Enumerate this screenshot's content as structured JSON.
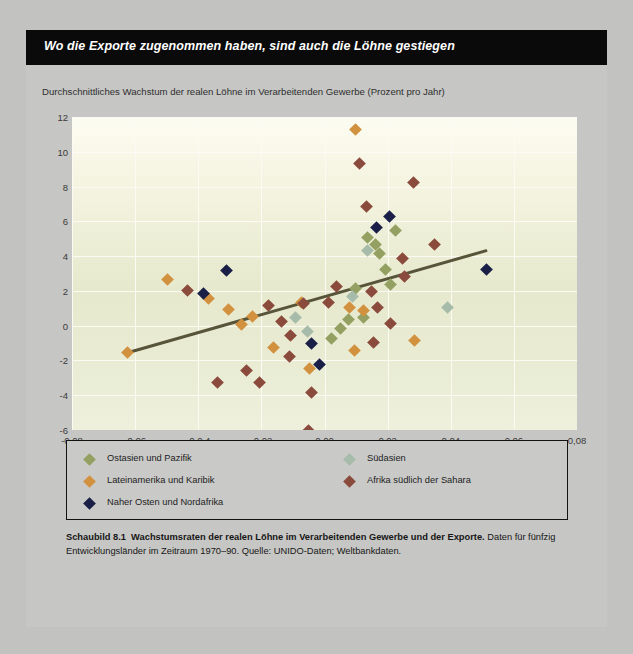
{
  "banner": {
    "title": "Wo die Exporte zugenommen haben, sind auch die Löhne gestiegen"
  },
  "legend": {
    "entries": [
      {
        "label": "Ostasien und Pazifik",
        "color": "#93a062"
      },
      {
        "label": "Lateinamerika und Karibik",
        "color": "#d2913f"
      },
      {
        "label": "Naher Osten und Nordafrika",
        "color": "#191f46"
      },
      {
        "label": "Südasien",
        "color": "#a7bbaa"
      },
      {
        "label": "Afrika südlich der Sahara",
        "color": "#8a4a3c"
      }
    ]
  },
  "caption": {
    "figure_number": "Schaubild 8.1",
    "bold_title": "Wachstumsraten der realen Löhne im Verarbeitenden Gewerbe und der Exporte.",
    "body": "Daten für fünfzig Entwicklungsländer im Zeitraum 1970–90. Quelle: UNIDO-Daten; Weltbankdaten."
  },
  "chart_data": {
    "type": "scatter",
    "title": "Wo die Exporte zugenommen haben, sind auch die Löhne gestiegen",
    "ylabel": "Durchschnittliches Wachstum der realen Löhne im Verarbeitenden Gewerbe (Prozent pro Jahr)",
    "xlabel": "Durchschnittliche jährliche Änderung der Exportquote (Exporte: BIP)",
    "xlim": [
      -0.08,
      0.08
    ],
    "ylim": [
      -6,
      12
    ],
    "xticks": [
      -0.08,
      -0.06,
      -0.04,
      -0.02,
      0.0,
      0.02,
      0.04,
      0.06,
      0.08
    ],
    "xticklabels": [
      "-0,08",
      "-0,06",
      "-0,0 4",
      "-0,02",
      "0,00",
      "0,02",
      "0,04",
      "0,06",
      "0,08"
    ],
    "yticks": [
      12,
      10,
      8,
      6,
      4,
      2,
      0,
      -2,
      -4,
      -6
    ],
    "yticklabels": [
      "12",
      "10",
      "8",
      "6",
      "4",
      "2",
      "0",
      "-2",
      "-4",
      "-6"
    ],
    "grid": true,
    "legend_position": "below-plot",
    "colors": {
      "east_asia_pacific": "#93a062",
      "latin_america_caribbean": "#d2913f",
      "middle_east_north_africa": "#191f46",
      "south_asia": "#a7bbaa",
      "sub_saharan_africa": "#8a4a3c",
      "trendline": "#57543a",
      "plot_background": "#eceedb",
      "page_background": "#c6c6c4",
      "banner_background": "#0a0a0a"
    },
    "trendline": {
      "x": [
        -0.0625,
        0.0518
      ],
      "y": [
        -1.55,
        4.35
      ]
    },
    "series": [
      {
        "name": "Ostasien und Pazifik",
        "color": "#93a062",
        "points": [
          [
            0.0135,
            5.05
          ],
          [
            0.0163,
            4.65
          ],
          [
            0.0175,
            4.15
          ],
          [
            0.0225,
            5.45
          ],
          [
            0.0192,
            3.25
          ],
          [
            0.021,
            2.35
          ],
          [
            0.0098,
            2.15
          ],
          [
            0.0075,
            0.35
          ],
          [
            0.005,
            -0.15
          ],
          [
            0.0022,
            -0.75
          ],
          [
            0.0122,
            0.45
          ]
        ]
      },
      {
        "name": "Lateinamerika und Karibik",
        "color": "#d2913f",
        "points": [
          [
            -0.0625,
            -1.55
          ],
          [
            -0.0498,
            2.65
          ],
          [
            -0.0262,
            0.05
          ],
          [
            -0.0368,
            1.55
          ],
          [
            -0.0228,
            0.55
          ],
          [
            -0.0305,
            0.95
          ],
          [
            -0.0072,
            1.35
          ],
          [
            0.0078,
            1.05
          ],
          [
            0.0122,
            0.85
          ],
          [
            -0.0162,
            -1.25
          ],
          [
            -0.0048,
            -2.45
          ],
          [
            0.0095,
            -1.45
          ],
          [
            0.0098,
            11.3
          ],
          [
            0.0285,
            -0.85
          ]
        ]
      },
      {
        "name": "Naher Osten und Nordafrika",
        "color": "#191f46",
        "points": [
          [
            -0.0312,
            3.15
          ],
          [
            -0.0382,
            1.85
          ],
          [
            0.0165,
            5.65
          ],
          [
            0.0205,
            6.25
          ],
          [
            -0.0042,
            -1.05
          ],
          [
            -0.0015,
            -2.25
          ],
          [
            0.0512,
            3.25
          ]
        ]
      },
      {
        "name": "Südasien",
        "color": "#a7bbaa",
        "points": [
          [
            0.0135,
            4.35
          ],
          [
            0.0088,
            1.65
          ],
          [
            -0.0092,
            0.45
          ],
          [
            -0.0055,
            -0.35
          ],
          [
            0.039,
            1.05
          ]
        ]
      },
      {
        "name": "Afrika südlich der Sahara",
        "color": "#8a4a3c",
        "points": [
          [
            -0.0435,
            2.05
          ],
          [
            -0.0338,
            -3.25
          ],
          [
            -0.0248,
            -2.55
          ],
          [
            -0.0205,
            -3.25
          ],
          [
            -0.0178,
            1.15
          ],
          [
            -0.0135,
            0.25
          ],
          [
            -0.0108,
            -0.55
          ],
          [
            -0.0112,
            -1.75
          ],
          [
            -0.0065,
            1.25
          ],
          [
            -0.0042,
            -3.85
          ],
          [
            -0.0052,
            -6.0
          ],
          [
            0.0012,
            1.35
          ],
          [
            0.0038,
            2.25
          ],
          [
            0.011,
            9.35
          ],
          [
            0.0132,
            6.85
          ],
          [
            0.0148,
            1.95
          ],
          [
            0.0168,
            1.05
          ],
          [
            0.0155,
            -0.95
          ],
          [
            0.0252,
            2.85
          ],
          [
            0.0282,
            8.25
          ],
          [
            0.0348,
            4.65
          ],
          [
            0.0248,
            3.85
          ],
          [
            0.0208,
            0.15
          ]
        ]
      }
    ]
  }
}
